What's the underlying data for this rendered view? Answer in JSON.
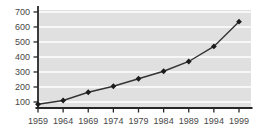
{
  "window": {
    "background": "#ffffff"
  },
  "chart": {
    "plot_bg": "#e0e0e0",
    "gridline_color": "#ffffff",
    "axis_color": "#262626",
    "line_color": "#333333",
    "marker_color": "#1c1c1c",
    "label_color": "#474747"
  },
  "chart_data": {
    "type": "line",
    "x": [
      "1959",
      "1964",
      "1969",
      "1974",
      "1979",
      "1984",
      "1989",
      "1994",
      "1999"
    ],
    "values": [
      85,
      110,
      165,
      205,
      255,
      305,
      370,
      470,
      635
    ],
    "yticks": [
      100,
      200,
      300,
      400,
      500,
      600,
      700
    ],
    "ylim": [
      60,
      713
    ],
    "grid": "horizontal",
    "legend": "none",
    "marker": "diamond",
    "plot_area_fill": "gray-panel-white-gridlines"
  }
}
